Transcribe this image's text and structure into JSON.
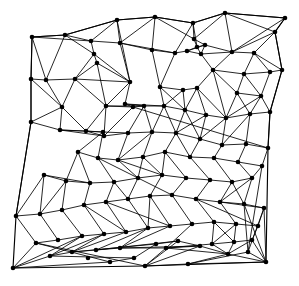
{
  "figure": {
    "type": "mesh-diagram",
    "background_color": "#ffffff",
    "edge_color": "#000000",
    "node_color": "#000000",
    "edge_width": 0.85,
    "boundary_edge_width": 1.15,
    "node_radius": 2.3,
    "width": 299,
    "height": 286
  },
  "chart_data": {
    "type": "scatter",
    "xlabel": "",
    "ylabel": "",
    "xlim": [
      0,
      299
    ],
    "ylim": [
      0,
      286
    ],
    "grid": false,
    "legend": "none",
    "node_count": 118,
    "edge_count": 312,
    "nodes": [
      [
        32,
        37
      ],
      [
        65,
        35
      ],
      [
        117,
        20
      ],
      [
        155,
        17
      ],
      [
        193,
        23
      ],
      [
        225,
        13
      ],
      [
        285,
        18
      ],
      [
        275,
        32
      ],
      [
        194,
        39
      ],
      [
        197,
        47
      ],
      [
        205,
        45
      ],
      [
        187,
        51
      ],
      [
        201,
        54
      ],
      [
        232,
        52
      ],
      [
        254,
        53
      ],
      [
        175,
        53
      ],
      [
        152,
        50
      ],
      [
        120,
        43
      ],
      [
        91,
        41
      ],
      [
        94,
        54
      ],
      [
        97,
        63
      ],
      [
        31,
        79
      ],
      [
        46,
        80
      ],
      [
        75,
        79
      ],
      [
        282,
        70
      ],
      [
        270,
        72
      ],
      [
        244,
        74
      ],
      [
        213,
        70
      ],
      [
        237,
        93
      ],
      [
        261,
        96
      ],
      [
        197,
        88
      ],
      [
        183,
        90
      ],
      [
        160,
        87
      ],
      [
        130,
        82
      ],
      [
        106,
        106
      ],
      [
        133,
        107
      ],
      [
        31,
        122
      ],
      [
        62,
        107
      ],
      [
        60,
        130
      ],
      [
        86,
        131
      ],
      [
        104,
        136
      ],
      [
        125,
        104
      ],
      [
        270,
        112
      ],
      [
        250,
        114
      ],
      [
        226,
        118
      ],
      [
        206,
        115
      ],
      [
        185,
        110
      ],
      [
        164,
        106
      ],
      [
        144,
        106
      ],
      [
        268,
        148
      ],
      [
        246,
        144
      ],
      [
        222,
        145
      ],
      [
        200,
        139
      ],
      [
        176,
        133
      ],
      [
        152,
        132
      ],
      [
        128,
        133
      ],
      [
        103,
        132
      ],
      [
        78,
        152
      ],
      [
        98,
        158
      ],
      [
        118,
        160
      ],
      [
        143,
        157
      ],
      [
        165,
        152
      ],
      [
        190,
        157
      ],
      [
        214,
        158
      ],
      [
        238,
        162
      ],
      [
        262,
        166
      ],
      [
        252,
        178
      ],
      [
        232,
        182
      ],
      [
        210,
        180
      ],
      [
        186,
        178
      ],
      [
        162,
        175
      ],
      [
        138,
        178
      ],
      [
        114,
        182
      ],
      [
        90,
        183
      ],
      [
        66,
        181
      ],
      [
        44,
        175
      ],
      [
        16,
        216
      ],
      [
        40,
        214
      ],
      [
        62,
        210
      ],
      [
        84,
        205
      ],
      [
        106,
        202
      ],
      [
        128,
        199
      ],
      [
        150,
        196
      ],
      [
        172,
        195
      ],
      [
        196,
        199
      ],
      [
        220,
        202
      ],
      [
        244,
        204
      ],
      [
        264,
        208
      ],
      [
        258,
        226
      ],
      [
        236,
        224
      ],
      [
        214,
        222
      ],
      [
        192,
        224
      ],
      [
        170,
        226
      ],
      [
        148,
        228
      ],
      [
        126,
        232
      ],
      [
        104,
        234
      ],
      [
        82,
        236
      ],
      [
        58,
        240
      ],
      [
        36,
        243
      ],
      [
        13,
        268
      ],
      [
        50,
        256
      ],
      [
        72,
        252
      ],
      [
        96,
        250
      ],
      [
        120,
        248
      ],
      [
        145,
        266
      ],
      [
        166,
        248
      ],
      [
        188,
        264
      ],
      [
        212,
        244
      ],
      [
        234,
        242
      ],
      [
        252,
        240
      ],
      [
        266,
        262
      ],
      [
        248,
        252
      ],
      [
        228,
        254
      ],
      [
        200,
        246
      ],
      [
        178,
        241
      ],
      [
        156,
        244
      ],
      [
        134,
        258
      ],
      [
        110,
        262
      ],
      [
        88,
        258
      ]
    ],
    "boundary_path": [
      [
        32,
        37
      ],
      [
        65,
        35
      ],
      [
        117,
        20
      ],
      [
        155,
        17
      ],
      [
        193,
        23
      ],
      [
        225,
        13
      ],
      [
        285,
        18
      ],
      [
        275,
        32
      ],
      [
        282,
        70
      ],
      [
        270,
        112
      ],
      [
        268,
        148
      ],
      [
        266,
        262
      ],
      [
        145,
        266
      ],
      [
        13,
        268
      ],
      [
        16,
        216
      ],
      [
        31,
        122
      ],
      [
        31,
        79
      ]
    ],
    "edges": [
      [
        0,
        1
      ],
      [
        1,
        2
      ],
      [
        2,
        3
      ],
      [
        3,
        4
      ],
      [
        4,
        5
      ],
      [
        5,
        6
      ],
      [
        6,
        7
      ],
      [
        7,
        24
      ],
      [
        24,
        42
      ],
      [
        42,
        49
      ],
      [
        49,
        65
      ],
      [
        65,
        111
      ],
      [
        111,
        106
      ],
      [
        106,
        104
      ],
      [
        104,
        98
      ],
      [
        98,
        76
      ],
      [
        76,
        36
      ],
      [
        36,
        21
      ],
      [
        21,
        0
      ],
      [
        0,
        22
      ],
      [
        0,
        18
      ],
      [
        1,
        18
      ],
      [
        1,
        19
      ],
      [
        1,
        22
      ],
      [
        2,
        17
      ],
      [
        2,
        18
      ],
      [
        2,
        33
      ],
      [
        3,
        16
      ],
      [
        3,
        17
      ],
      [
        3,
        8
      ],
      [
        4,
        8
      ],
      [
        4,
        9
      ],
      [
        4,
        15
      ],
      [
        5,
        8
      ],
      [
        5,
        13
      ],
      [
        5,
        6
      ],
      [
        6,
        13
      ],
      [
        7,
        13
      ],
      [
        7,
        14
      ],
      [
        8,
        9
      ],
      [
        8,
        10
      ],
      [
        9,
        10
      ],
      [
        9,
        11
      ],
      [
        9,
        12
      ],
      [
        10,
        11
      ],
      [
        10,
        13
      ],
      [
        11,
        12
      ],
      [
        11,
        15
      ],
      [
        12,
        13
      ],
      [
        12,
        27
      ],
      [
        13,
        14
      ],
      [
        13,
        27
      ],
      [
        14,
        24
      ],
      [
        14,
        25
      ],
      [
        14,
        26
      ],
      [
        15,
        16
      ],
      [
        15,
        17
      ],
      [
        15,
        32
      ],
      [
        16,
        17
      ],
      [
        16,
        32
      ],
      [
        17,
        18
      ],
      [
        17,
        33
      ],
      [
        18,
        19
      ],
      [
        19,
        20
      ],
      [
        19,
        23
      ],
      [
        20,
        23
      ],
      [
        20,
        33
      ],
      [
        20,
        34
      ],
      [
        21,
        22
      ],
      [
        21,
        37
      ],
      [
        22,
        23
      ],
      [
        22,
        37
      ],
      [
        23,
        34
      ],
      [
        23,
        37
      ],
      [
        24,
        25
      ],
      [
        25,
        26
      ],
      [
        25,
        29
      ],
      [
        26,
        27
      ],
      [
        26,
        28
      ],
      [
        26,
        29
      ],
      [
        27,
        28
      ],
      [
        27,
        30
      ],
      [
        28,
        29
      ],
      [
        28,
        44
      ],
      [
        29,
        42
      ],
      [
        29,
        43
      ],
      [
        30,
        31
      ],
      [
        30,
        44
      ],
      [
        30,
        45
      ],
      [
        31,
        32
      ],
      [
        31,
        46
      ],
      [
        32,
        47
      ],
      [
        33,
        34
      ],
      [
        33,
        41
      ],
      [
        34,
        35
      ],
      [
        34,
        39
      ],
      [
        34,
        40
      ],
      [
        35,
        40
      ],
      [
        35,
        41
      ],
      [
        35,
        48
      ],
      [
        36,
        37
      ],
      [
        36,
        38
      ],
      [
        37,
        38
      ],
      [
        38,
        39
      ],
      [
        38,
        56
      ],
      [
        39,
        40
      ],
      [
        39,
        56
      ],
      [
        40,
        55
      ],
      [
        41,
        47
      ],
      [
        41,
        48
      ],
      [
        42,
        43
      ],
      [
        43,
        44
      ],
      [
        43,
        50
      ],
      [
        44,
        45
      ],
      [
        44,
        51
      ],
      [
        45,
        46
      ],
      [
        45,
        52
      ],
      [
        46,
        47
      ],
      [
        46,
        53
      ],
      [
        47,
        48
      ],
      [
        47,
        53
      ],
      [
        48,
        54
      ],
      [
        49,
        50
      ],
      [
        49,
        65
      ],
      [
        50,
        51
      ],
      [
        50,
        64
      ],
      [
        51,
        52
      ],
      [
        51,
        63
      ],
      [
        52,
        53
      ],
      [
        52,
        62
      ],
      [
        53,
        54
      ],
      [
        53,
        61
      ],
      [
        54,
        55
      ],
      [
        54,
        60
      ],
      [
        55,
        56
      ],
      [
        55,
        59
      ],
      [
        56,
        57
      ],
      [
        56,
        58
      ],
      [
        57,
        58
      ],
      [
        57,
        74
      ],
      [
        58,
        59
      ],
      [
        58,
        72
      ],
      [
        59,
        60
      ],
      [
        59,
        71
      ],
      [
        60,
        61
      ],
      [
        60,
        70
      ],
      [
        61,
        62
      ],
      [
        61,
        69
      ],
      [
        62,
        63
      ],
      [
        62,
        68
      ],
      [
        63,
        64
      ],
      [
        63,
        67
      ],
      [
        64,
        65
      ],
      [
        64,
        66
      ],
      [
        65,
        66
      ],
      [
        66,
        67
      ],
      [
        66,
        86
      ],
      [
        67,
        68
      ],
      [
        67,
        85
      ],
      [
        68,
        69
      ],
      [
        68,
        84
      ],
      [
        69,
        70
      ],
      [
        69,
        83
      ],
      [
        70,
        71
      ],
      [
        70,
        82
      ],
      [
        71,
        72
      ],
      [
        71,
        81
      ],
      [
        72,
        73
      ],
      [
        72,
        80
      ],
      [
        73,
        74
      ],
      [
        73,
        79
      ],
      [
        74,
        75
      ],
      [
        74,
        78
      ],
      [
        75,
        76
      ],
      [
        75,
        77
      ],
      [
        76,
        77
      ],
      [
        77,
        78
      ],
      [
        77,
        97
      ],
      [
        78,
        79
      ],
      [
        78,
        96
      ],
      [
        79,
        80
      ],
      [
        79,
        95
      ],
      [
        80,
        81
      ],
      [
        80,
        94
      ],
      [
        81,
        82
      ],
      [
        81,
        93
      ],
      [
        82,
        83
      ],
      [
        82,
        92
      ],
      [
        83,
        84
      ],
      [
        83,
        91
      ],
      [
        84,
        85
      ],
      [
        84,
        90
      ],
      [
        85,
        86
      ],
      [
        85,
        89
      ],
      [
        86,
        87
      ],
      [
        86,
        111
      ],
      [
        87,
        88
      ],
      [
        87,
        110
      ],
      [
        88,
        89
      ],
      [
        88,
        109
      ],
      [
        89,
        90
      ],
      [
        89,
        108
      ],
      [
        90,
        91
      ],
      [
        90,
        107
      ],
      [
        91,
        92
      ],
      [
        91,
        105
      ],
      [
        92,
        93
      ],
      [
        92,
        103
      ],
      [
        93,
        94
      ],
      [
        93,
        102
      ],
      [
        94,
        95
      ],
      [
        94,
        101
      ],
      [
        95,
        96
      ],
      [
        95,
        100
      ],
      [
        96,
        97
      ],
      [
        96,
        99
      ],
      [
        97,
        98
      ],
      [
        98,
        99
      ],
      [
        99,
        100
      ],
      [
        99,
        117
      ],
      [
        100,
        101
      ],
      [
        100,
        116
      ],
      [
        101,
        102
      ],
      [
        101,
        115
      ],
      [
        102,
        103
      ],
      [
        102,
        114
      ],
      [
        103,
        105
      ],
      [
        103,
        113
      ],
      [
        104,
        113
      ],
      [
        104,
        114
      ],
      [
        105,
        107
      ],
      [
        105,
        113
      ],
      [
        106,
        110
      ],
      [
        106,
        112
      ],
      [
        107,
        108
      ],
      [
        107,
        112
      ],
      [
        108,
        109
      ],
      [
        108,
        112
      ],
      [
        109,
        110
      ],
      [
        110,
        111
      ],
      [
        112,
        113
      ],
      [
        113,
        114
      ],
      [
        114,
        115
      ],
      [
        115,
        116
      ],
      [
        116,
        117
      ],
      [
        117,
        98
      ],
      [
        104,
        105
      ],
      [
        106,
        111
      ],
      [
        86,
        110
      ],
      [
        87,
        111
      ],
      [
        34,
        48
      ],
      [
        41,
        35
      ],
      [
        30,
        46
      ],
      [
        12,
        11
      ],
      [
        10,
        12
      ],
      [
        15,
        11
      ],
      [
        27,
        44
      ],
      [
        44,
        52
      ],
      [
        55,
        40
      ],
      [
        56,
        39
      ],
      [
        23,
        33
      ],
      [
        19,
        33
      ],
      [
        47,
        54
      ],
      [
        53,
        62
      ],
      [
        61,
        53
      ],
      [
        70,
        61
      ],
      [
        82,
        70
      ],
      [
        93,
        82
      ],
      [
        103,
        93
      ],
      [
        113,
        103
      ],
      [
        114,
        104
      ],
      [
        5,
        7
      ],
      [
        24,
        25
      ],
      [
        42,
        43
      ],
      [
        49,
        50
      ],
      [
        65,
        64
      ],
      [
        111,
        86
      ],
      [
        98,
        97
      ],
      [
        76,
        75
      ],
      [
        36,
        38
      ],
      [
        21,
        22
      ],
      [
        59,
        70
      ],
      [
        60,
        71
      ],
      [
        71,
        83
      ],
      [
        72,
        81
      ],
      [
        80,
        92
      ],
      [
        79,
        94
      ],
      [
        95,
        101
      ],
      [
        96,
        100
      ],
      [
        89,
        107
      ],
      [
        90,
        108
      ],
      [
        85,
        87
      ],
      [
        84,
        88
      ],
      [
        66,
        85
      ],
      [
        67,
        86
      ],
      [
        43,
        51
      ],
      [
        45,
        53
      ],
      [
        46,
        52
      ],
      [
        31,
        47
      ],
      [
        32,
        46
      ],
      [
        48,
        55
      ],
      [
        54,
        59
      ],
      [
        57,
        73
      ],
      [
        58,
        71
      ],
      [
        73,
        75
      ],
      [
        74,
        77
      ],
      [
        37,
        39
      ],
      [
        38,
        40
      ],
      [
        40,
        56
      ],
      [
        35,
        49
      ],
      [
        29,
        44
      ],
      [
        28,
        43
      ],
      [
        109,
        112
      ],
      [
        110,
        112
      ],
      [
        105,
        112
      ]
    ]
  }
}
